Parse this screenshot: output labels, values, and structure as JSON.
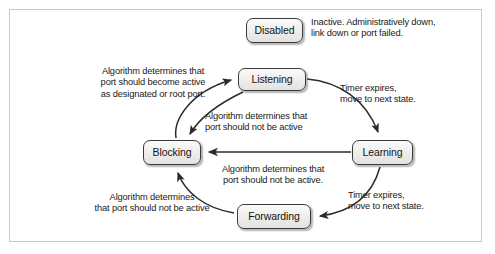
{
  "figure": {
    "frame_border_color": "#c9c9c9",
    "background_color": "#ffffff"
  },
  "states": [
    {
      "id": "disabled",
      "label": "Disabled"
    },
    {
      "id": "listening",
      "label": "Listening"
    },
    {
      "id": "blocking",
      "label": "Blocking"
    },
    {
      "id": "learning",
      "label": "Learning"
    },
    {
      "id": "forwarding",
      "label": "Forwarding"
    }
  ],
  "labels": {
    "disabled_desc": "Inactive. Administratively down,\nlink down or port failed.",
    "blocking_to_listening": "Algorithm determines that\nport should become active\nas designated or root port.",
    "listening_to_blocking": "Algorithm determines that\nport should not be active",
    "listening_to_learning": "Timer expires,\nmove to next state.",
    "learning_to_blocking": "Algorithm determines that\nport should not be active.",
    "learning_to_forwarding": "Timer expires,\nmove to next state.",
    "forwarding_to_blocking": "Algorithm determines\nthat port should not be active"
  },
  "transitions": [
    {
      "from": "blocking",
      "to": "listening",
      "label_key": "blocking_to_listening"
    },
    {
      "from": "listening",
      "to": "blocking",
      "label_key": "listening_to_blocking"
    },
    {
      "from": "listening",
      "to": "learning",
      "label_key": "listening_to_learning"
    },
    {
      "from": "learning",
      "to": "blocking",
      "label_key": "learning_to_blocking"
    },
    {
      "from": "learning",
      "to": "forwarding",
      "label_key": "learning_to_forwarding"
    },
    {
      "from": "forwarding",
      "to": "blocking",
      "label_key": "forwarding_to_blocking"
    }
  ],
  "style": {
    "state_fill": "#f0efee",
    "state_border": "#3a3a3a",
    "arrow_color": "#2b2b2b",
    "text_color": "#1a1a1a"
  }
}
